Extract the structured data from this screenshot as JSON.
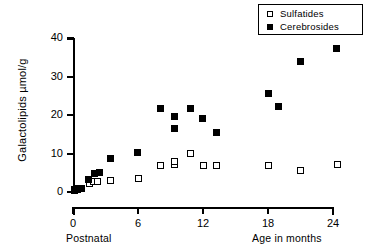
{
  "chart_data": {
    "type": "scatter",
    "title": "",
    "xlabel": "Age in months",
    "ylabel": "Galactolipids µmol/g",
    "xlim": [
      0,
      24
    ],
    "ylim": [
      0,
      40
    ],
    "xticks": [
      0,
      6,
      12,
      18,
      24
    ],
    "xtick_labels": [
      "0",
      "6",
      "12",
      "18",
      "24"
    ],
    "yticks": [
      0,
      10,
      20,
      30,
      40
    ],
    "ytick_labels": [
      "0",
      "10",
      "20",
      "30",
      "40"
    ],
    "grid": false,
    "legend_position": "top-right",
    "axis_caption_left": "Postnatal",
    "axis_caption_right": "Age in months",
    "series": [
      {
        "name": "Sulfatides",
        "marker": "open-square",
        "color": "#ffffff",
        "edge_color": "#000000",
        "points": [
          {
            "x": 0.1,
            "y": 0.3
          },
          {
            "x": 0.45,
            "y": 0.6
          },
          {
            "x": 1.5,
            "y": 2.1
          },
          {
            "x": 1.9,
            "y": 2.8
          },
          {
            "x": 2.3,
            "y": 2.8
          },
          {
            "x": 3.5,
            "y": 3.0
          },
          {
            "x": 6.0,
            "y": 3.4
          },
          {
            "x": 8.1,
            "y": 6.8
          },
          {
            "x": 9.4,
            "y": 7.1
          },
          {
            "x": 9.4,
            "y": 8.0
          },
          {
            "x": 10.8,
            "y": 9.9
          },
          {
            "x": 12.0,
            "y": 6.8
          },
          {
            "x": 13.2,
            "y": 6.9
          },
          {
            "x": 18.0,
            "y": 7.0
          },
          {
            "x": 21.0,
            "y": 5.6
          },
          {
            "x": 24.4,
            "y": 7.2
          }
        ]
      },
      {
        "name": "Cerebrosides",
        "marker": "filled-square",
        "color": "#000000",
        "edge_color": "#000000",
        "points": [
          {
            "x": 0.1,
            "y": 0.6
          },
          {
            "x": 0.5,
            "y": 1.0
          },
          {
            "x": 0.75,
            "y": 0.9
          },
          {
            "x": 1.45,
            "y": 3.3
          },
          {
            "x": 1.95,
            "y": 4.8
          },
          {
            "x": 2.45,
            "y": 5.0
          },
          {
            "x": 3.5,
            "y": 8.8
          },
          {
            "x": 5.95,
            "y": 10.2
          },
          {
            "x": 8.1,
            "y": 21.8
          },
          {
            "x": 9.35,
            "y": 19.7
          },
          {
            "x": 9.35,
            "y": 16.6
          },
          {
            "x": 10.8,
            "y": 21.8
          },
          {
            "x": 11.95,
            "y": 19.1
          },
          {
            "x": 13.25,
            "y": 15.4
          },
          {
            "x": 18.0,
            "y": 25.6
          },
          {
            "x": 19.0,
            "y": 22.1
          },
          {
            "x": 21.0,
            "y": 34.0
          },
          {
            "x": 24.3,
            "y": 37.4
          }
        ]
      }
    ]
  },
  "legend": {
    "items": [
      {
        "label": "Sulfatides",
        "marker": "open-square"
      },
      {
        "label": "Cerebrosides",
        "marker": "filled-square"
      }
    ]
  }
}
